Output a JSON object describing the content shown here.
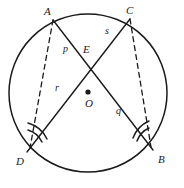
{
  "figure": {
    "background_color": "#ffffff",
    "stroke_color": "#1a1a1a",
    "label_color": "#1a1a1a"
  },
  "circle": {
    "center_label": "O",
    "center_x": 88,
    "center_y": 93,
    "radius": 79,
    "center_dot_radius": 2.6
  },
  "points": [
    {
      "name": "A",
      "label": "A",
      "x": 53,
      "y": 20,
      "label_x": 44,
      "label_y": 6
    },
    {
      "name": "C",
      "label": "C",
      "x": 130,
      "y": 19,
      "label_x": 126,
      "label_y": 5
    },
    {
      "name": "D",
      "label": "D",
      "x": 27,
      "y": 152,
      "label_x": 16,
      "label_y": 156
    },
    {
      "name": "B",
      "label": "B",
      "x": 153,
      "y": 150,
      "label_x": 158,
      "label_y": 154
    },
    {
      "name": "E",
      "label": "E",
      "x": 88,
      "y": 65,
      "label_x": 83,
      "label_y": 44
    }
  ],
  "segment_labels": [
    {
      "name": "p",
      "label": "p",
      "x": 63,
      "y": 44,
      "segment": "AE"
    },
    {
      "name": "s",
      "label": "s",
      "x": 105,
      "y": 26,
      "segment": "CE"
    },
    {
      "name": "r",
      "label": "r",
      "x": 55,
      "y": 83,
      "segment": "ED"
    },
    {
      "name": "q",
      "label": "q",
      "x": 116,
      "y": 106,
      "segment": "EB"
    }
  ],
  "chords": [
    {
      "name": "chord-AB",
      "from": "A",
      "to": "B",
      "style": "solid",
      "via": "E"
    },
    {
      "name": "chord-CD",
      "from": "C",
      "to": "D",
      "style": "solid",
      "via": "E"
    }
  ],
  "dashed_segments": [
    {
      "name": "segment-AD",
      "from": "A",
      "to": "D",
      "style": "dashed"
    },
    {
      "name": "segment-CB",
      "from": "C",
      "to": "B",
      "style": "dashed"
    }
  ],
  "angle_marks": [
    {
      "name": "angle-at-D",
      "vertex": "D",
      "arcs": 2,
      "note": "double arc at D"
    },
    {
      "name": "angle-at-B",
      "vertex": "B",
      "arcs": 2,
      "note": "double arc at B"
    }
  ]
}
